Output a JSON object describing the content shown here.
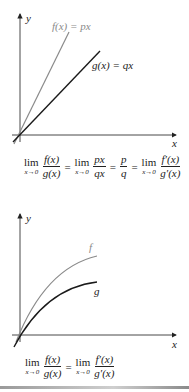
{
  "figure1": {
    "y_label": "y",
    "x_label": "x",
    "f_label": "f(x) = px",
    "g_label": "g(x) = qx",
    "colors": {
      "f": "#8a8a8a",
      "g": "#1a1a1a",
      "axes": "#333333"
    },
    "formula": {
      "lim1": "lim",
      "sub1": "x→0",
      "num1": "f(x)",
      "den1": "g(x)",
      "eq1": "=",
      "lim2": "lim",
      "sub2": "x→0",
      "num2": "px",
      "den2": "qx",
      "eq2": "=",
      "num3": "p",
      "den3": "q",
      "eq3": "=",
      "lim4": "lim",
      "sub4": "x→0",
      "num4": "f′(x)",
      "den4": "g′(x)"
    }
  },
  "figure2": {
    "y_label": "y",
    "x_label": "x",
    "f_label": "f",
    "g_label": "g",
    "colors": {
      "f": "#8a8a8a",
      "g": "#1a1a1a",
      "axes": "#333333"
    },
    "formula": {
      "lim1": "lim",
      "sub1": "x→0",
      "num1": "f(x)",
      "den1": "g(x)",
      "eq1": "=",
      "lim2": "lim",
      "sub2": "x→0",
      "num2": "f′(x)",
      "den2": "g′(x)"
    }
  }
}
